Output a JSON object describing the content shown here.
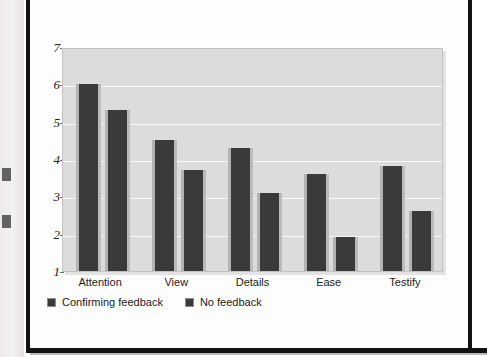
{
  "chart_data": {
    "type": "bar",
    "title": "",
    "xlabel": "",
    "ylabel": "Ratings of witnessing experience",
    "categories": [
      "Attention",
      "View",
      "Details",
      "Ease",
      "Testify"
    ],
    "series": [
      {
        "name": "Confirming feedback",
        "color": "#3a3a3a",
        "values": [
          6.0,
          4.5,
          4.3,
          3.6,
          3.8
        ]
      },
      {
        "name": "No feedback",
        "color": "#3a3a3a",
        "values": [
          5.3,
          3.7,
          3.1,
          1.9,
          2.6
        ]
      }
    ],
    "ylim": [
      1,
      7
    ],
    "y_ticks": [
      "1",
      "2",
      "3",
      "4",
      "5",
      "6",
      "7"
    ],
    "grid": true,
    "legend_position": "bottom-left",
    "plot_background": "#dcdcdc",
    "gridline_color": "#f7f7f7"
  },
  "legend": {
    "items": [
      {
        "label": "Confirming feedback"
      },
      {
        "label": "No feedback"
      }
    ]
  }
}
